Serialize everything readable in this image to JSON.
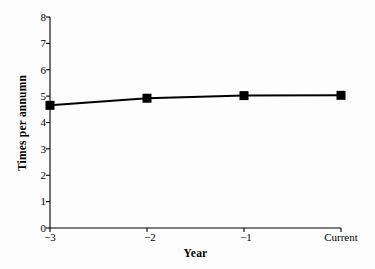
{
  "chart_data": {
    "type": "line",
    "title": "",
    "xlabel": "Year",
    "ylabel": "Times per annumn",
    "categories": [
      "−3",
      "−2",
      "−1",
      "Current"
    ],
    "values": [
      4.65,
      4.92,
      5.02,
      5.03
    ],
    "series": [
      {
        "name": "Times per annumn",
        "values": [
          4.65,
          4.92,
          5.02,
          5.03
        ]
      }
    ],
    "ylim": [
      0,
      8
    ],
    "yticks": [
      "0",
      "1",
      "2",
      "3",
      "4",
      "5",
      "6",
      "7",
      "8"
    ],
    "ytick_values": [
      0,
      1,
      2,
      3,
      4,
      5,
      6,
      7,
      8
    ],
    "xticks": [
      "−3",
      "−2",
      "−1",
      "Current"
    ],
    "grid": false,
    "legend": false,
    "marker": "square",
    "marker_color": "#000000",
    "line_color": "#000000",
    "axis_color": "#000000",
    "background_color": "#fdfdfd"
  },
  "axes": {
    "y_axis_name": "y-axis",
    "x_axis_name": "x-axis"
  }
}
